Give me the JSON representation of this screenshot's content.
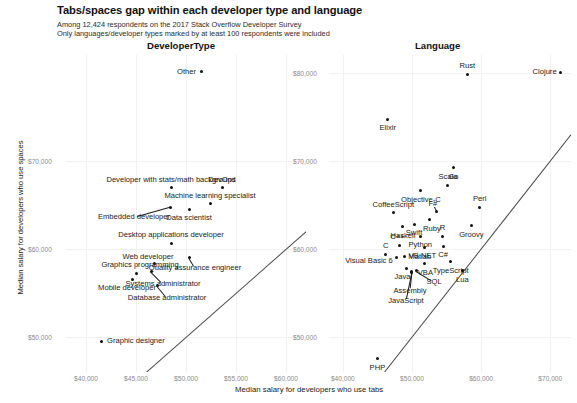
{
  "header": {
    "title": "Tabs/spaces gap within each developer type and language",
    "subtitle_1": "Among 12,424 respondents on the 2017 Stack Overflow Developer Survey",
    "subtitle_2": "Only languages/developer types marked by at least 100 respondents were included"
  },
  "axes": {
    "ylabel": "Median salary for developers who use spaces",
    "xlabel": "Median salary for developers who use tabs"
  },
  "facets": {
    "left": "DeveloperType",
    "right": "Language"
  },
  "chart_data": {
    "type": "scatter",
    "title": "Tabs/spaces gap within each developer type and language",
    "subtitle": "Among 12,424 respondents on the 2017 Stack Overflow Developer Survey. Only languages/developer types marked by at least 100 respondents were included",
    "xlabel": "Median salary for developers who use tabs",
    "ylabel": "Median salary for developers who use spaces",
    "grid": true,
    "legend": "none",
    "reference_line": "y = x (diagonal identity line)",
    "panels": [
      {
        "name": "DeveloperType",
        "xlim": [
          38000,
          62000
        ],
        "ylim": [
          46000,
          82000
        ],
        "xticks": [
          "$40,000",
          "$45,000",
          "$50,000",
          "$55,000",
          "$60,000"
        ],
        "xtick_values": [
          40000,
          45000,
          50000,
          55000,
          60000
        ],
        "yticks": [
          "$70,000",
          "$60,000",
          "$50,000"
        ],
        "ytick_values": [
          70000,
          60000,
          50000
        ],
        "points": [
          {
            "label": "Other",
            "x": 51500,
            "y": 80100,
            "lx": -5,
            "ly": 0,
            "anchor": "end"
          },
          {
            "label": "Developer with stats/math background",
            "x": 48500,
            "y": 66900,
            "lx": 0,
            "ly": -8,
            "anchor": "mid"
          },
          {
            "label": "DevOps",
            "x": 53600,
            "y": 66900,
            "lx": 0,
            "ly": -8,
            "anchor": "mid"
          },
          {
            "label": "Machine learning specialist",
            "x": 52400,
            "y": 65100,
            "lx": 0,
            "ly": -8,
            "anchor": "mid"
          },
          {
            "label": "Embedded developer",
            "x": 48400,
            "y": 64700,
            "lx": -36,
            "ly": 10,
            "anchor": "mid",
            "leader": true
          },
          {
            "label": "Data scientist",
            "x": 50300,
            "y": 64500,
            "lx": 0,
            "ly": 9,
            "anchor": "mid"
          },
          {
            "label": "Desktop applications developer",
            "x": 48500,
            "y": 60600,
            "lx": 0,
            "ly": -8,
            "anchor": "mid"
          },
          {
            "label": "Quality assurance engineer",
            "x": 50300,
            "y": 59000,
            "lx": 6,
            "ly": 10,
            "anchor": "mid",
            "leader": true
          },
          {
            "label": "Web developer",
            "x": 46800,
            "y": 58300,
            "lx": -6,
            "ly": -7,
            "anchor": "mid"
          },
          {
            "label": "Graphics programming",
            "x": 45000,
            "y": 57200,
            "lx": 4,
            "ly": -8,
            "anchor": "mid"
          },
          {
            "label": "Systems administrator",
            "x": 46500,
            "y": 57400,
            "lx": 12,
            "ly": 12,
            "anchor": "mid",
            "leader": true
          },
          {
            "label": "Mobile developer",
            "x": 44600,
            "y": 56500,
            "lx": -5,
            "ly": 8,
            "anchor": "mid"
          },
          {
            "label": "Database administrator",
            "x": 47100,
            "y": 55800,
            "lx": 10,
            "ly": 12,
            "anchor": "mid",
            "leader": true
          },
          {
            "label": "Graphic designer",
            "x": 41500,
            "y": 49500,
            "lx": 6,
            "ly": 0,
            "anchor": "start"
          }
        ]
      },
      {
        "name": "Language",
        "xlim": [
          38000,
          73000
        ],
        "ylim": [
          46000,
          82000
        ],
        "xticks": [
          "$40,000",
          "$50,000",
          "$60,000",
          "$70,000"
        ],
        "xtick_values": [
          40000,
          50000,
          60000,
          70000
        ],
        "yticks": [
          "$80,000",
          "$70,000",
          "$60,000",
          "$50,000"
        ],
        "ytick_values": [
          80000,
          70000,
          60000,
          50000
        ],
        "points": [
          {
            "label": "Rust",
            "x": 58000,
            "y": 79800,
            "lx": 0,
            "ly": -8,
            "anchor": "mid"
          },
          {
            "label": "Clojure",
            "x": 71500,
            "y": 80000,
            "lx": -4,
            "ly": -1,
            "anchor": "end",
            "leader": true
          },
          {
            "label": "Elixir",
            "x": 46500,
            "y": 74700,
            "lx": 0,
            "ly": 9,
            "anchor": "mid"
          },
          {
            "label": "Go",
            "x": 56000,
            "y": 69200,
            "lx": 0,
            "ly": 9,
            "anchor": "mid"
          },
          {
            "label": "Scala",
            "x": 55200,
            "y": 67200,
            "lx": 0,
            "ly": -8,
            "anchor": "mid"
          },
          {
            "label": "Objective-C",
            "x": 51300,
            "y": 66600,
            "lx": 0,
            "ly": 9,
            "anchor": "mid"
          },
          {
            "label": "Perl",
            "x": 59800,
            "y": 64700,
            "lx": 0,
            "ly": -8,
            "anchor": "mid"
          },
          {
            "label": "F#",
            "x": 53600,
            "y": 64200,
            "lx": -4,
            "ly": -8,
            "anchor": "mid",
            "leader": true
          },
          {
            "label": "CoffeeScript",
            "x": 47300,
            "y": 64100,
            "lx": 0,
            "ly": -8,
            "anchor": "mid"
          },
          {
            "label": "Ruby",
            "x": 52600,
            "y": 63300,
            "lx": 2,
            "ly": 9,
            "anchor": "mid"
          },
          {
            "label": "Groovy",
            "x": 58600,
            "y": 62600,
            "lx": 0,
            "ly": 9,
            "anchor": "mid"
          },
          {
            "label": "Swift",
            "x": 50300,
            "y": 62800,
            "lx": 0,
            "ly": 9,
            "anchor": "mid"
          },
          {
            "label": "Haskell",
            "x": 48700,
            "y": 62500,
            "lx": 0,
            "ly": 9,
            "anchor": "mid"
          },
          {
            "label": "Python",
            "x": 51200,
            "y": 61400,
            "lx": 0,
            "ly": 9,
            "anchor": "mid"
          },
          {
            "label": "R",
            "x": 54400,
            "y": 61400,
            "lx": 0,
            "ly": -8,
            "anchor": "mid"
          },
          {
            "label": "C++",
            "x": 48200,
            "y": 60400,
            "lx": -2,
            "ly": -8,
            "anchor": "mid"
          },
          {
            "label": "VB.NET",
            "x": 51800,
            "y": 60100,
            "lx": -2,
            "ly": 8,
            "anchor": "mid"
          },
          {
            "label": "C#",
            "x": 54500,
            "y": 60200,
            "lx": 0,
            "ly": 8,
            "anchor": "mid"
          },
          {
            "label": "C",
            "x": 46200,
            "y": 59400,
            "lx": 0,
            "ly": -8,
            "anchor": "mid"
          },
          {
            "label": "Matlab",
            "x": 48900,
            "y": 59100,
            "lx": 4,
            "ly": 0,
            "anchor": "start"
          },
          {
            "label": "Visual Basic 6",
            "x": 47800,
            "y": 59000,
            "lx": -4,
            "ly": 3,
            "anchor": "end"
          },
          {
            "label": "VBA",
            "x": 51800,
            "y": 58300,
            "lx": 1,
            "ly": 9,
            "anchor": "mid"
          },
          {
            "label": "TypeScript",
            "x": 55600,
            "y": 58500,
            "lx": 0,
            "ly": 9,
            "anchor": "mid"
          },
          {
            "label": "Lua",
            "x": 57300,
            "y": 57500,
            "lx": 0,
            "ly": 9,
            "anchor": "mid"
          },
          {
            "label": "Java",
            "x": 49200,
            "y": 57800,
            "lx": -4,
            "ly": 9,
            "anchor": "mid"
          },
          {
            "label": "SQL",
            "x": 50600,
            "y": 57500,
            "lx": 18,
            "ly": 11,
            "anchor": "mid",
            "leader": true
          },
          {
            "label": "Assembly",
            "x": 50000,
            "y": 57400,
            "lx": -2,
            "ly": 19,
            "anchor": "mid",
            "leader": true
          },
          {
            "label": "JavaScript",
            "x": 50000,
            "y": 57300,
            "lx": -6,
            "ly": 29,
            "anchor": "mid",
            "leader": true
          },
          {
            "label": "PHP",
            "x": 45000,
            "y": 47500,
            "lx": 0,
            "ly": 9,
            "anchor": "mid"
          }
        ]
      }
    ]
  }
}
